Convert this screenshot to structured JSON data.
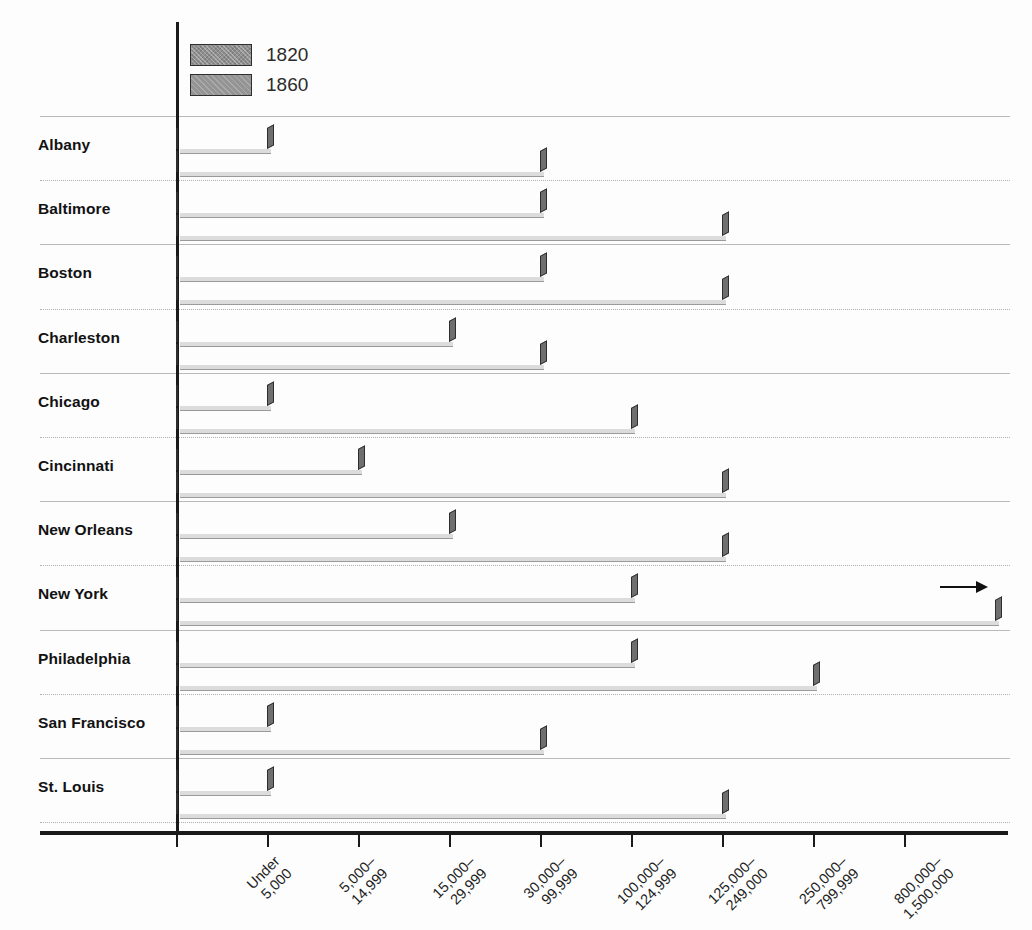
{
  "legend": {
    "position": "top-left",
    "entries": [
      {
        "label": "1820",
        "pattern": "hatched"
      },
      {
        "label": "1860",
        "pattern": "solid"
      }
    ]
  },
  "annotations": [
    {
      "name": "overflow-arrow",
      "glyph": "→",
      "applies_to": "New York 1860",
      "meaning": "value extends beyond chart area"
    }
  ],
  "chart_data": {
    "type": "bar",
    "orientation": "horizontal",
    "title": "",
    "subtitle": "",
    "xlabel": "",
    "ylabel": "",
    "grid": true,
    "legend_position": "top-left",
    "categories": [
      "Albany",
      "Baltimore",
      "Boston",
      "Charleston",
      "Chicago",
      "Cincinnati",
      "New Orleans",
      "New York",
      "Philadelphia",
      "San Francisco",
      "St. Louis"
    ],
    "x_tick_labels": [
      "Under\n5,000",
      "5,000–\n14,999",
      "15,000–\n29,999",
      "30,000–\n99,999",
      "100,000–\n124,999",
      "125,000–\n249,000",
      "250,000–\n799,999",
      "800,000–\n1,500,000"
    ],
    "x_band_count": 8,
    "x_band_index_range": [
      0,
      8
    ],
    "series": [
      {
        "name": "1820",
        "values": [
          1,
          4,
          4,
          3,
          1,
          2,
          3,
          5,
          5,
          1,
          1
        ],
        "value_labels": [
          "Under 5,000",
          "30,000–99,999",
          "30,000–99,999",
          "15,000–29,999",
          "Under 5,000",
          "5,000–14,999",
          "15,000–29,999",
          "100,000–124,999",
          "100,000–124,999",
          "Under 5,000",
          "Under 5,000"
        ]
      },
      {
        "name": "1860",
        "values": [
          4,
          6,
          6,
          4,
          5,
          6,
          6,
          9,
          7,
          4,
          6
        ],
        "value_labels": [
          "30,000–99,999",
          "125,000–249,000",
          "125,000–249,000",
          "30,000–99,999",
          "100,000–124,999",
          "125,000–249,000",
          "125,000–249,000",
          "800,000–1,500,000",
          "250,000–799,999",
          "30,000–99,999",
          "125,000–249,000"
        ]
      }
    ]
  }
}
